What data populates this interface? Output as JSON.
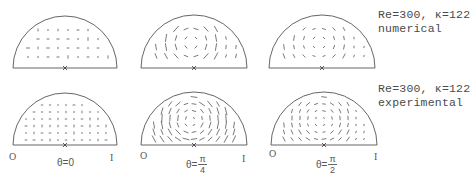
{
  "figure": {
    "ink_color": "#555555",
    "arrow_color": "#3a3a3a",
    "panels": [
      {
        "id": "num-theta0",
        "row": "numerical",
        "theta": "0",
        "cx": 65,
        "cy": 68,
        "r": 52,
        "pattern": "sparse"
      },
      {
        "id": "num-theta-pi4",
        "row": "numerical",
        "theta": "pi/4",
        "cx": 194,
        "cy": 68,
        "r": 53,
        "pattern": "vortex-strong"
      },
      {
        "id": "num-theta-pi2",
        "row": "numerical",
        "theta": "pi/2",
        "cx": 322,
        "cy": 68,
        "r": 53,
        "pattern": "vortex-weak"
      },
      {
        "id": "exp-theta0",
        "row": "experimental",
        "theta": "0",
        "cx": 65,
        "cy": 145,
        "r": 52,
        "pattern": "grid-dots"
      },
      {
        "id": "exp-theta-pi4",
        "row": "experimental",
        "theta": "pi/4",
        "cx": 194,
        "cy": 145,
        "r": 53,
        "pattern": "vortex-strong-grid"
      },
      {
        "id": "exp-theta-pi2",
        "row": "experimental",
        "theta": "pi/2",
        "cx": 324,
        "cy": 145,
        "r": 53,
        "pattern": "vortex-weak-grid"
      }
    ]
  },
  "captions": {
    "numerical": {
      "params": "Re=300, κ=122",
      "kind": "numerical"
    },
    "experimental": {
      "params": "Re=300, κ=122",
      "kind": "experimental"
    }
  },
  "axis_labels": {
    "outer": "O",
    "inner": "I",
    "center_marker": "x"
  },
  "theta_labels": [
    {
      "prefix": "θ=",
      "value": "0"
    },
    {
      "prefix": "θ=",
      "num": "π",
      "den": "4"
    },
    {
      "prefix": "θ=",
      "num": "π",
      "den": "2"
    }
  ]
}
